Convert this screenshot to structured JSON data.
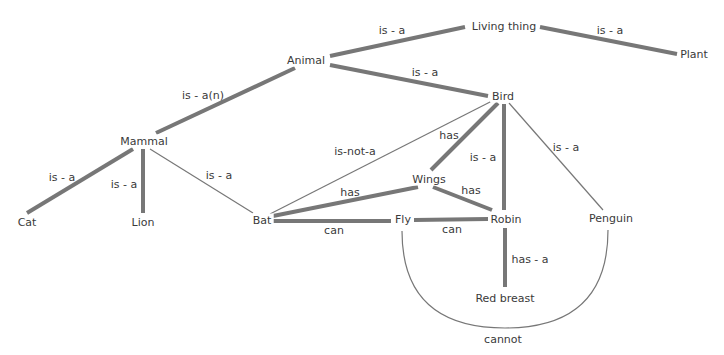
{
  "diagram": {
    "colors": {
      "edge": "#777777",
      "text": "#3a3a3a",
      "background": "#ffffff"
    },
    "nodes": [
      {
        "id": "living_thing",
        "label": "Living thing",
        "x": 504,
        "y": 26
      },
      {
        "id": "plant",
        "label": "Plant",
        "x": 694,
        "y": 54
      },
      {
        "id": "animal",
        "label": "Animal",
        "x": 306,
        "y": 60
      },
      {
        "id": "bird",
        "label": "Bird",
        "x": 503,
        "y": 96
      },
      {
        "id": "mammal",
        "label": "Mammal",
        "x": 144,
        "y": 141
      },
      {
        "id": "wings",
        "label": "Wings",
        "x": 429,
        "y": 179
      },
      {
        "id": "cat",
        "label": "Cat",
        "x": 27,
        "y": 222
      },
      {
        "id": "lion",
        "label": "Lion",
        "x": 143,
        "y": 222
      },
      {
        "id": "bat",
        "label": "Bat",
        "x": 262,
        "y": 220
      },
      {
        "id": "fly",
        "label": "Fly",
        "x": 403,
        "y": 219
      },
      {
        "id": "robin",
        "label": "Robin",
        "x": 506,
        "y": 219
      },
      {
        "id": "penguin",
        "label": "Penguin",
        "x": 611,
        "y": 218
      },
      {
        "id": "red_breast",
        "label": "Red breast",
        "x": 505,
        "y": 298
      }
    ],
    "edges": [
      {
        "from": "animal",
        "to": "living_thing",
        "label": "is - a",
        "lx": 392,
        "ly": 30,
        "weight": "thick",
        "x1": 330,
        "y1": 56,
        "x2": 465,
        "y2": 27
      },
      {
        "from": "living_thing",
        "to": "plant",
        "label": "is - a",
        "lx": 610,
        "ly": 30,
        "weight": "thick",
        "x1": 540,
        "y1": 27,
        "x2": 677,
        "y2": 54
      },
      {
        "from": "animal",
        "to": "bird",
        "label": "is - a",
        "lx": 425,
        "ly": 72,
        "weight": "thick",
        "x1": 330,
        "y1": 65,
        "x2": 488,
        "y2": 96
      },
      {
        "from": "mammal",
        "to": "animal",
        "label": "is - a(n)",
        "lx": 203,
        "ly": 95,
        "weight": "thick",
        "x1": 156,
        "y1": 133,
        "x2": 295,
        "y2": 68
      },
      {
        "from": "cat",
        "to": "mammal",
        "label": "is - a",
        "lx": 62,
        "ly": 177,
        "weight": "thick",
        "x1": 27,
        "y1": 213,
        "x2": 133,
        "y2": 149
      },
      {
        "from": "lion",
        "to": "mammal",
        "label": "is - a",
        "lx": 124,
        "ly": 184,
        "weight": "thick",
        "x1": 143,
        "y1": 213,
        "x2": 143,
        "y2": 149
      },
      {
        "from": "bat",
        "to": "mammal",
        "label": "is - a",
        "lx": 219,
        "ly": 175,
        "weight": "thin",
        "x1": 253,
        "y1": 213,
        "x2": 150,
        "y2": 149
      },
      {
        "from": "bat",
        "to": "bird",
        "label": "is-not-a",
        "lx": 355,
        "ly": 151,
        "weight": "thin",
        "x1": 270,
        "y1": 214,
        "x2": 492,
        "y2": 101
      },
      {
        "from": "bird",
        "to": "wings",
        "label": "has",
        "lx": 449,
        "ly": 135,
        "weight": "thick",
        "x1": 498,
        "y1": 103,
        "x2": 431,
        "y2": 170
      },
      {
        "from": "bird",
        "to": "robin",
        "label": "is - a",
        "lx": 483,
        "ly": 157,
        "weight": "thick",
        "x1": 504,
        "y1": 104,
        "x2": 504,
        "y2": 210
      },
      {
        "from": "bird",
        "to": "penguin",
        "label": "is - a",
        "lx": 566,
        "ly": 147,
        "weight": "thin",
        "x1": 509,
        "y1": 103,
        "x2": 603,
        "y2": 210
      },
      {
        "from": "bat",
        "to": "wings",
        "label": "has",
        "lx": 350,
        "ly": 192,
        "weight": "thick",
        "x1": 273,
        "y1": 216,
        "x2": 418,
        "y2": 187
      },
      {
        "from": "wings",
        "to": "robin",
        "label": "has",
        "lx": 471,
        "ly": 190,
        "weight": "thick",
        "x1": 433,
        "y1": 187,
        "x2": 492,
        "y2": 210
      },
      {
        "from": "bat",
        "to": "fly",
        "label": "can",
        "lx": 334,
        "ly": 230,
        "weight": "thick",
        "x1": 273,
        "y1": 221,
        "x2": 391,
        "y2": 221
      },
      {
        "from": "fly",
        "to": "robin",
        "label": "can",
        "lx": 452,
        "ly": 229,
        "weight": "thick",
        "x1": 414,
        "y1": 220,
        "x2": 488,
        "y2": 219
      },
      {
        "from": "robin",
        "to": "red_breast",
        "label": "has - a",
        "lx": 530,
        "ly": 259,
        "weight": "thick",
        "x1": 505,
        "y1": 228,
        "x2": 505,
        "y2": 287
      }
    ],
    "arc": {
      "from": "penguin",
      "to": "fly",
      "label": "cannot",
      "lx": 503,
      "ly": 339,
      "path": "M 402 231 Q 402 328 505 328 Q 608 328 608 230"
    }
  }
}
